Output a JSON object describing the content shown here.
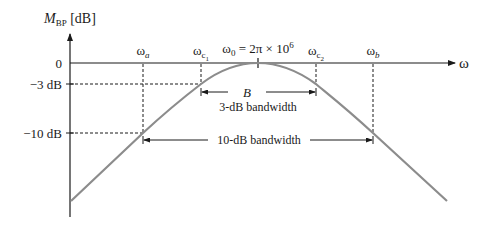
{
  "diagram": {
    "y_axis_label_main": "M",
    "y_axis_label_sub": "BP",
    "y_axis_label_unit": " [dB]",
    "x_axis_label": "ω",
    "y_ticks": [
      {
        "label": "0",
        "db": 0
      },
      {
        "label": "−3 dB",
        "db": -3
      },
      {
        "label": "−10 dB",
        "db": -10
      }
    ],
    "x_markers": [
      {
        "main": "ω",
        "sub": "a",
        "sub_italic": true
      },
      {
        "main": "ω",
        "sub": "c",
        "subsub": "1"
      },
      {
        "main": "ω",
        "sub": "0",
        "extra": " = 2π × 10",
        "sup": "6"
      },
      {
        "main": "ω",
        "sub": "c",
        "subsub": "2"
      },
      {
        "main": "ω",
        "sub": "b",
        "sub_italic": true
      }
    ],
    "bandwidth_3db": {
      "symbol": "B",
      "label": "3-dB bandwidth"
    },
    "bandwidth_10db": {
      "label": "10-dB bandwidth"
    },
    "colors": {
      "axis": "#1a1a1a",
      "curve": "#8c8c8c",
      "dash": "#1a1a1a"
    }
  }
}
